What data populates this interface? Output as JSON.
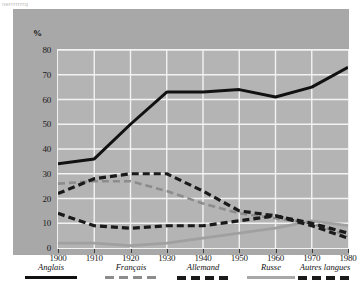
{
  "top_cut_text": "nerrrrrrrq",
  "chart_data": {
    "type": "line",
    "title": "",
    "xlabel": "",
    "ylabel": "%",
    "x": [
      1900,
      1910,
      1920,
      1930,
      1940,
      1950,
      1960,
      1970,
      1980
    ],
    "xtick_labels": [
      "1900",
      "1910",
      "1920",
      "1930",
      "1940",
      "1950",
      "1960",
      "1970",
      "1980"
    ],
    "ytick_labels": [
      "80",
      "70",
      "60",
      "50",
      "40",
      "30",
      "20",
      "10",
      "0"
    ],
    "ylim": [
      0,
      80
    ],
    "xlim": [
      1900,
      1980
    ],
    "grid": true,
    "legend_position": "bottom",
    "series": [
      {
        "name": "Anglais",
        "style": "solid",
        "color": "#111111",
        "width": 3,
        "values": [
          34,
          36,
          50,
          63,
          63,
          64,
          61,
          65,
          73
        ]
      },
      {
        "name": "Français",
        "style": "dashed-thin",
        "color": "#8c8c8c",
        "width": 2.6,
        "values": [
          26,
          27,
          27,
          23,
          18,
          14,
          12,
          10,
          5
        ]
      },
      {
        "name": "Allemand",
        "style": "dashed-thick",
        "color": "#1a1a1a",
        "width": 3.2,
        "values": [
          22,
          28,
          30,
          30,
          23,
          15,
          13,
          9,
          4
        ]
      },
      {
        "name": "Russe",
        "style": "solid",
        "color": "#a0a0a0",
        "width": 2.8,
        "values": [
          2,
          2,
          1,
          2,
          4,
          6,
          8,
          11,
          9
        ]
      },
      {
        "name": "Autres langues",
        "style": "dashed-thick",
        "color": "#1a1a1a",
        "width": 3.2,
        "values": [
          14,
          9,
          8,
          9,
          9,
          11,
          13,
          10,
          6
        ]
      }
    ]
  },
  "legend": {
    "items": [
      {
        "label": "Anglais",
        "swatch": "solid-black"
      },
      {
        "label": "Français",
        "swatch": "dashed-gray"
      },
      {
        "label": "Allemand",
        "swatch": "dashed-black-thick"
      },
      {
        "label": "Russe",
        "swatch": "solid-gray"
      },
      {
        "label": "Autres langues",
        "swatch": "dashed-black-thick"
      }
    ]
  }
}
